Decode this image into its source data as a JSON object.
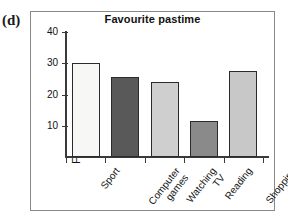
{
  "figure": {
    "part_label": "(d)"
  },
  "chart_data": {
    "type": "bar",
    "title": "Favourite pastime",
    "xlabel": "",
    "ylabel": "Frequency",
    "categories": [
      "Sport",
      "Computer games",
      "Watching TV",
      "Reading",
      "Shopping"
    ],
    "category_lines": [
      [
        "Sport"
      ],
      [
        "Computer",
        "games"
      ],
      [
        "Watching",
        "TV"
      ],
      [
        "Reading"
      ],
      [
        "Shopping"
      ]
    ],
    "values": [
      30,
      25.5,
      24,
      11.5,
      27.5
    ],
    "bar_colors": [
      "#f7f7f5",
      "#595959",
      "#cfcfcf",
      "#8a8a8a",
      "#c8c8c8"
    ],
    "bar_edge_color": "#2b2b2b",
    "ylim": [
      0,
      40
    ],
    "yticks": [
      10,
      20,
      30,
      40
    ],
    "ytick_labels": [
      "10",
      "20",
      "30",
      "40"
    ],
    "grid": false,
    "legend": false
  }
}
